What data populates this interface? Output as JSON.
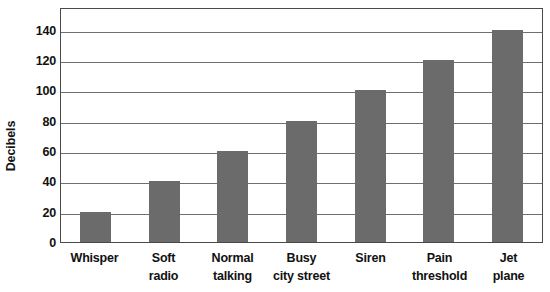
{
  "chart_data": {
    "type": "bar",
    "title": "",
    "xlabel": "",
    "ylabel": "Decibels",
    "categories": [
      "Whisper",
      "Soft radio",
      "Normal talking",
      "Busy city street",
      "Siren",
      "Pain threshold",
      "Jet plane"
    ],
    "category_lines": [
      [
        "Whisper"
      ],
      [
        "Soft",
        "radio"
      ],
      [
        "Normal",
        "talking"
      ],
      [
        "Busy",
        "city street"
      ],
      [
        "Siren"
      ],
      [
        "Pain",
        "threshold"
      ],
      [
        "Jet",
        "plane"
      ]
    ],
    "values": [
      20,
      40,
      60,
      80,
      100,
      120,
      140
    ],
    "ylim": [
      0,
      155
    ],
    "yticks": [
      0,
      20,
      40,
      60,
      80,
      100,
      120,
      140
    ],
    "ytick_labels": [
      "0",
      "20",
      "40",
      "60",
      "80",
      "100",
      "120",
      "140"
    ],
    "grid": true,
    "grid_axis": "y",
    "legend": false,
    "bar_color": "#6b6b6b",
    "grid_color": "#6f6f6f",
    "frame_color": "#4a4a4a",
    "text_color": "#111111"
  }
}
